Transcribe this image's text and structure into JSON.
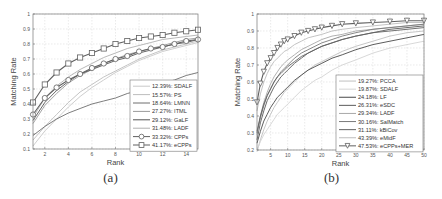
{
  "chart_data": [
    {
      "type": "line",
      "panel_label": "(a)",
      "title": "",
      "xlabel": "Rank",
      "ylabel": "Matching Rate",
      "xlim": [
        1,
        15
      ],
      "ylim": [
        0.1,
        1.0
      ],
      "xticks": [
        2,
        4,
        6,
        8,
        10,
        12,
        14
      ],
      "yticks": [
        0.1,
        0.2,
        0.3,
        0.4,
        0.5,
        0.6,
        0.7,
        0.8,
        0.9,
        1
      ],
      "grid": true,
      "legend_position": "lower right",
      "x": [
        1,
        2,
        3,
        4,
        5,
        6,
        7,
        8,
        9,
        10,
        11,
        12,
        13,
        14,
        15
      ],
      "series": [
        {
          "name": "12.39%: SDALF",
          "color": "#c8c8c8",
          "marker": "none",
          "values": [
            0.12,
            0.22,
            0.3,
            0.38,
            0.45,
            0.51,
            0.56,
            0.61,
            0.65,
            0.69,
            0.72,
            0.75,
            0.77,
            0.79,
            0.81
          ]
        },
        {
          "name": "15.57%: PS",
          "color": "#bdbdbd",
          "marker": "none",
          "values": [
            0.16,
            0.25,
            0.33,
            0.41,
            0.48,
            0.53,
            0.58,
            0.62,
            0.66,
            0.7,
            0.73,
            0.76,
            0.78,
            0.8,
            0.82
          ]
        },
        {
          "name": "18.64%: LMNN",
          "color": "#6e6e6e",
          "marker": "none",
          "values": [
            0.19,
            0.25,
            0.3,
            0.34,
            0.37,
            0.4,
            0.42,
            0.44,
            0.47,
            0.49,
            0.51,
            0.54,
            0.56,
            0.59,
            0.61
          ]
        },
        {
          "name": "27.27%: ITML",
          "color": "#9a9a9a",
          "marker": "none",
          "values": [
            0.27,
            0.39,
            0.47,
            0.54,
            0.59,
            0.63,
            0.67,
            0.7,
            0.73,
            0.75,
            0.77,
            0.79,
            0.81,
            0.83,
            0.84
          ]
        },
        {
          "name": "29.12%: GaLF",
          "color": "#555555",
          "marker": "none",
          "values": [
            0.29,
            0.41,
            0.49,
            0.55,
            0.6,
            0.63,
            0.66,
            0.69,
            0.71,
            0.74,
            0.76,
            0.78,
            0.8,
            0.81,
            0.83
          ]
        },
        {
          "name": "31.48%: LADF",
          "color": "#b0b0b0",
          "marker": "none",
          "values": [
            0.31,
            0.44,
            0.52,
            0.58,
            0.63,
            0.67,
            0.71,
            0.74,
            0.77,
            0.79,
            0.81,
            0.83,
            0.84,
            0.85,
            0.86
          ]
        },
        {
          "name": "33.32%: CPPs",
          "color": "#606060",
          "marker": "circle",
          "values": [
            0.33,
            0.44,
            0.51,
            0.56,
            0.6,
            0.64,
            0.67,
            0.7,
            0.72,
            0.75,
            0.77,
            0.78,
            0.8,
            0.82,
            0.83
          ]
        },
        {
          "name": "41.17%: eCPPs",
          "color": "#606060",
          "marker": "square",
          "values": [
            0.41,
            0.53,
            0.61,
            0.67,
            0.71,
            0.74,
            0.77,
            0.8,
            0.82,
            0.84,
            0.85,
            0.86,
            0.875,
            0.885,
            0.895
          ]
        }
      ]
    },
    {
      "type": "line",
      "panel_label": "(b)",
      "title": "",
      "xlabel": "Rank",
      "ylabel": "Matching Rate",
      "xlim": [
        1,
        50
      ],
      "ylim": [
        0.2,
        1.0
      ],
      "xticks": [
        5,
        10,
        15,
        20,
        25,
        30,
        35,
        40,
        45,
        50
      ],
      "yticks": [
        0.2,
        0.3,
        0.4,
        0.5,
        0.6,
        0.7,
        0.8,
        0.9,
        1
      ],
      "grid": true,
      "legend_position": "lower right",
      "x": [
        1,
        2,
        3,
        4,
        5,
        6,
        7,
        8,
        9,
        10,
        12,
        14,
        16,
        18,
        20,
        23,
        26,
        30,
        35,
        40,
        45,
        50
      ],
      "series": [
        {
          "name": "19.27%: PCCA",
          "color": "#c0c0c0",
          "marker": "none",
          "values": [
            0.19,
            0.26,
            0.32,
            0.37,
            0.41,
            0.45,
            0.48,
            0.51,
            0.54,
            0.56,
            0.6,
            0.64,
            0.67,
            0.7,
            0.72,
            0.75,
            0.78,
            0.81,
            0.84,
            0.87,
            0.89,
            0.9
          ]
        },
        {
          "name": "19.87%: SDALF",
          "color": "#d4d4d4",
          "marker": "none",
          "values": [
            0.2,
            0.25,
            0.29,
            0.32,
            0.35,
            0.38,
            0.41,
            0.43,
            0.45,
            0.47,
            0.51,
            0.55,
            0.58,
            0.61,
            0.63,
            0.67,
            0.7,
            0.73,
            0.77,
            0.8,
            0.82,
            0.84
          ]
        },
        {
          "name": "24.18%: LF",
          "color": "#4a4a4a",
          "marker": "none",
          "values": [
            0.24,
            0.31,
            0.37,
            0.41,
            0.45,
            0.48,
            0.51,
            0.53,
            0.55,
            0.57,
            0.61,
            0.64,
            0.67,
            0.69,
            0.71,
            0.74,
            0.76,
            0.79,
            0.82,
            0.84,
            0.86,
            0.88
          ]
        },
        {
          "name": "26.31%: eSDC",
          "color": "#5a5a5a",
          "marker": "none",
          "values": [
            0.26,
            0.36,
            0.43,
            0.49,
            0.53,
            0.57,
            0.6,
            0.63,
            0.65,
            0.67,
            0.71,
            0.74,
            0.77,
            0.79,
            0.81,
            0.83,
            0.85,
            0.87,
            0.89,
            0.91,
            0.92,
            0.93
          ]
        },
        {
          "name": "29.34%: LADF",
          "color": "#a8a8a8",
          "marker": "none",
          "values": [
            0.29,
            0.4,
            0.48,
            0.54,
            0.59,
            0.63,
            0.66,
            0.69,
            0.71,
            0.73,
            0.76,
            0.79,
            0.81,
            0.83,
            0.85,
            0.87,
            0.88,
            0.9,
            0.91,
            0.92,
            0.93,
            0.94
          ]
        },
        {
          "name": "30.16%: SalMatch",
          "color": "#7a7a7a",
          "marker": "none",
          "values": [
            0.3,
            0.39,
            0.46,
            0.52,
            0.56,
            0.6,
            0.63,
            0.66,
            0.68,
            0.7,
            0.74,
            0.77,
            0.79,
            0.81,
            0.83,
            0.85,
            0.87,
            0.89,
            0.91,
            0.92,
            0.93,
            0.94
          ]
        },
        {
          "name": "31.11%: kBiCov",
          "color": "#626262",
          "marker": "none",
          "values": [
            0.31,
            0.4,
            0.47,
            0.52,
            0.56,
            0.6,
            0.63,
            0.65,
            0.67,
            0.69,
            0.72,
            0.75,
            0.77,
            0.79,
            0.81,
            0.83,
            0.85,
            0.87,
            0.89,
            0.9,
            0.91,
            0.92
          ]
        },
        {
          "name": "43.39%: eMidF",
          "color": "#bcbcbc",
          "marker": "none",
          "values": [
            0.43,
            0.53,
            0.6,
            0.65,
            0.69,
            0.72,
            0.74,
            0.76,
            0.78,
            0.79,
            0.82,
            0.84,
            0.86,
            0.87,
            0.88,
            0.9,
            0.91,
            0.92,
            0.93,
            0.94,
            0.95,
            0.95
          ]
        },
        {
          "name": "47.53%: eCPPs+MER",
          "color": "#606060",
          "marker": "triangle-down",
          "values": [
            0.48,
            0.59,
            0.66,
            0.71,
            0.74,
            0.77,
            0.8,
            0.82,
            0.84,
            0.85,
            0.87,
            0.89,
            0.9,
            0.91,
            0.92,
            0.93,
            0.94,
            0.945,
            0.95,
            0.955,
            0.96,
            0.96
          ]
        }
      ]
    }
  ]
}
